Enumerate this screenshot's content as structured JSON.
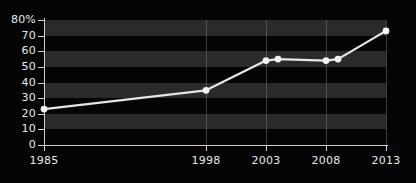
{
  "chart_data": {
    "type": "line",
    "title": "",
    "xlabel": "",
    "ylabel": "",
    "x": [
      1985,
      1998,
      2003,
      2004,
      2008,
      2009,
      2013
    ],
    "values": [
      23,
      35,
      54,
      55,
      54,
      55,
      73
    ],
    "series": [
      {
        "name": "",
        "x": [
          1985,
          1998,
          2003,
          2004,
          2008,
          2009,
          2013
        ],
        "values": [
          23,
          35,
          54,
          55,
          54,
          55,
          73
        ]
      }
    ],
    "xticks": [
      1985,
      1998,
      2003,
      2008,
      2013
    ],
    "xtick_labels": [
      "1985",
      "1998",
      "2003",
      "2008",
      "2013"
    ],
    "yticks": [
      0,
      10,
      20,
      30,
      40,
      50,
      60,
      70,
      80
    ],
    "ytick_labels": [
      "0",
      "10",
      "20",
      "30",
      "40",
      "50",
      "60",
      "70",
      "80%"
    ],
    "ylim": [
      0,
      80
    ],
    "grid": "vertical-gridlines-and-horizontal-bands",
    "legend": "none",
    "colors": {
      "background": "#050505",
      "band": "#2a2a2a",
      "axis": "#cfcfcf",
      "gridline": "#6e6e6e",
      "line": "#e6e6e6",
      "marker": "#f2f2f2",
      "text": "#e8e8e8"
    }
  }
}
